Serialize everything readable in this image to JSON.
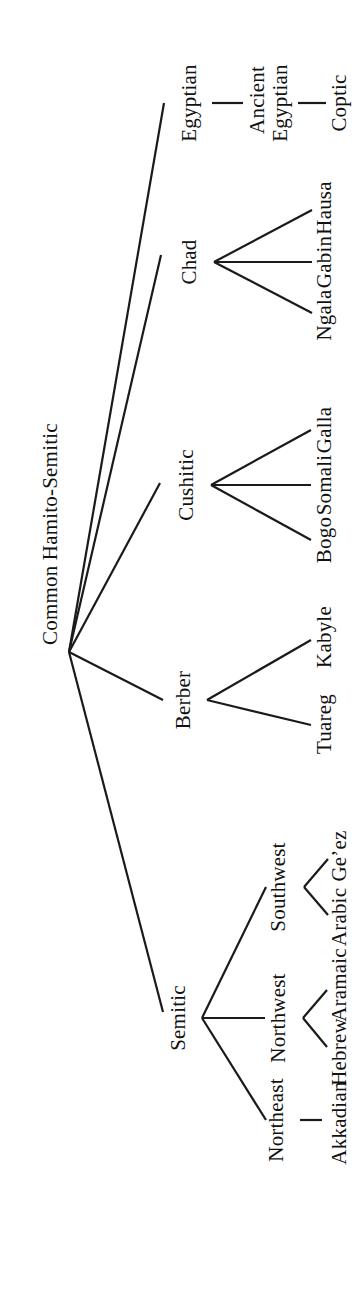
{
  "figure": {
    "type": "tree-diagram",
    "orientation": "rotated-90-counterclockwise",
    "background_color": "#ffffff",
    "line_color": "#1a1a1a",
    "text_color": "#111111"
  },
  "nodes": {
    "root": "Common Hamito-Semitic",
    "semitic": "Semitic",
    "berber": "Berber",
    "cushitic": "Cushitic",
    "chad": "Chad",
    "egyptian": "Egyptian",
    "northeast": "Northeast",
    "northwest": "Northwest",
    "southwest": "Southwest",
    "akkadian": "Akkadian",
    "hebrew": "Hebrew",
    "aramaic": "Aramaic",
    "arabic": "Arabic",
    "geez": "Ge’ez",
    "tuareg": "Tuareg",
    "kabyle": "Kabyle",
    "bogo": "Bogo",
    "somali": "Somali",
    "galla": "Galla",
    "hausa": "Hausa",
    "gabin": "Gabin",
    "ngala": "Ngala",
    "ancient_egyptian": "Ancient Egyptian",
    "coptic": "Coptic"
  },
  "tree": {
    "name": "Common Hamito-Semitic",
    "children": [
      {
        "name": "Semitic",
        "children": [
          {
            "name": "Northeast",
            "children": [
              {
                "name": "Akkadian"
              }
            ]
          },
          {
            "name": "Northwest",
            "children": [
              {
                "name": "Hebrew"
              },
              {
                "name": "Aramaic"
              }
            ]
          },
          {
            "name": "Southwest",
            "children": [
              {
                "name": "Arabic"
              },
              {
                "name": "Ge’ez"
              }
            ]
          }
        ]
      },
      {
        "name": "Berber",
        "children": [
          {
            "name": "Tuareg"
          },
          {
            "name": "Kabyle"
          }
        ]
      },
      {
        "name": "Cushitic",
        "children": [
          {
            "name": "Bogo"
          },
          {
            "name": "Somali"
          },
          {
            "name": "Galla"
          }
        ]
      },
      {
        "name": "Chad",
        "children": [
          {
            "name": "Hausa"
          },
          {
            "name": "Gabin"
          },
          {
            "name": "Ngala"
          }
        ]
      },
      {
        "name": "Egyptian",
        "children": [
          {
            "name": "Ancient Egyptian",
            "children": [
              {
                "name": "Coptic"
              }
            ]
          }
        ]
      }
    ]
  }
}
